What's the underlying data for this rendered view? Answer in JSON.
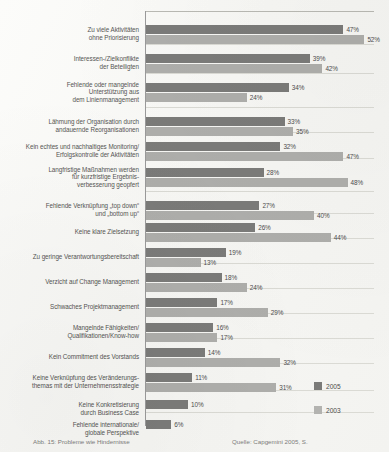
{
  "chart_data": {
    "type": "bar",
    "orientation": "horizontal",
    "title": "",
    "xlabel": "",
    "ylabel": "",
    "xlim": [
      0,
      55
    ],
    "grid": true,
    "legend_position": "bottom-right",
    "value_suffix": "%",
    "categories": [
      "Zu viele Aktivitäten\nohne Priorisierung",
      "Interessen-/Zielkonflikte\nder Beteiligten",
      "Fehlende oder mangelnde\nUnterstützung aus\ndem Linienmanagement",
      "Lähmung der Organisation durch\nandauernde Reorganisationen",
      "Kein echtes und nachhaltiges Monitoring/\nErfolgskontrolle der Aktivitäten",
      "Langfristige Maßnahmen werden\nfür kurzfristige Ergebnis-\nverbesserung geopfert",
      "Fehlende Verknüpfung „top down“\nund „bottom up“",
      "Keine klare Zielsetzung",
      "Zu geringe Verantwortungsbereitschaft",
      "Verzicht auf Change Management",
      "Schwaches Projektmanagement",
      "Mangelnde Fähigkeiten/\nQualifikationen/Know-how",
      "Kein Commitment des Vorstands",
      "Keine Verknüpfung des Veränderungs-\nthemas mit der Unternehmensstrategie",
      "Keine Konkretisierung\ndurch Business Case",
      "Fehlende internationale/\nglobale Perspektive"
    ],
    "series": [
      {
        "name": "2005",
        "color": "#7b7b79",
        "values": [
          47,
          39,
          34,
          33,
          32,
          28,
          27,
          26,
          19,
          18,
          17,
          16,
          14,
          11,
          10,
          6
        ],
        "labels": [
          "47%",
          "39%",
          "34%",
          "33%",
          "32%",
          "28%",
          "27%",
          "26%",
          "19%",
          "18%",
          "17%",
          "16%",
          "14%",
          "11%",
          "10%",
          "6%"
        ]
      },
      {
        "name": "2003",
        "color": "#aeaeab",
        "values": [
          52,
          42,
          24,
          35,
          47,
          48,
          40,
          44,
          13,
          24,
          29,
          17,
          32,
          31,
          null,
          null
        ],
        "labels": [
          "52%",
          "42%",
          "24%",
          "35%",
          "47%",
          "48%",
          "40%",
          "44%",
          "13%",
          "24%",
          "29%",
          "17%",
          "32%",
          "31%",
          "",
          ""
        ]
      }
    ]
  },
  "legend": {
    "items": [
      {
        "label": "2005",
        "color": "#7b7b79"
      },
      {
        "label": "2003",
        "color": "#b3b3b0"
      }
    ]
  },
  "caption": {
    "left": "Abb. 15: Probleme wie Hindernisse",
    "right": "Quelle: Capgemini 2005, S."
  }
}
